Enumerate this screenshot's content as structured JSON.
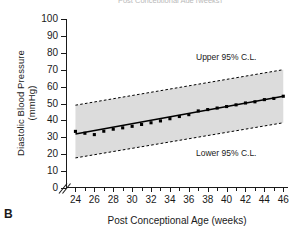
{
  "figure": {
    "panel_label": "B",
    "clipped_title_above": "Post Conceptional Age (weeks)"
  },
  "annotations": {
    "upper": "Upper 95% C.L.",
    "lower": "Lower 95% C.L."
  },
  "chart_data": {
    "type": "scatter",
    "title": "",
    "xlabel": "Post Conceptional Age (weeks)",
    "ylabel_line1": "Diastolic Blood Pressure",
    "ylabel_line2": "(mmHg)",
    "xlim": [
      23,
      46.5
    ],
    "ylim": [
      0,
      100
    ],
    "xticks": [
      24,
      25,
      26,
      27,
      28,
      29,
      30,
      31,
      32,
      33,
      34,
      35,
      36,
      37,
      38,
      39,
      40,
      41,
      42,
      43,
      44,
      45,
      46
    ],
    "xticklabels": [
      "24",
      "",
      "26",
      "",
      "28",
      "",
      "30",
      "",
      "32",
      "",
      "34",
      "",
      "36",
      "",
      "38",
      "",
      "40",
      "",
      "42",
      "",
      "44",
      "",
      "46"
    ],
    "yticks": [
      0,
      10,
      20,
      30,
      40,
      50,
      60,
      70,
      80,
      90,
      100
    ],
    "yticklabels": [
      "0",
      "10",
      "20",
      "30",
      "40",
      "50",
      "60",
      "70",
      "80",
      "90",
      "100"
    ],
    "grid": false,
    "axis_break_y": true,
    "legend_position": "none",
    "series": [
      {
        "name": "Mean diastolic blood pressure",
        "type": "scatter",
        "marker": "filled-square",
        "color": "#000000",
        "x": [
          24,
          25,
          26,
          27,
          28,
          29,
          30,
          31,
          32,
          33,
          34,
          35,
          36,
          37,
          38,
          39,
          40,
          41,
          42,
          43,
          44,
          45,
          46
        ],
        "values": [
          33.5,
          32.4,
          31.6,
          33.6,
          34.8,
          35.6,
          36.5,
          37.6,
          38.6,
          39.7,
          41.0,
          42.3,
          43.4,
          45.6,
          46.4,
          47.3,
          48.2,
          49.2,
          50.3,
          51.0,
          52.3,
          53.0,
          54.3
        ]
      },
      {
        "name": "Regression line",
        "type": "line",
        "style": "solid",
        "color": "#000000",
        "x": [
          24,
          46
        ],
        "values": [
          32.0,
          54.3
        ]
      },
      {
        "name": "Upper 95% C.L.",
        "type": "line",
        "style": "dotted",
        "color": "#000000",
        "x": [
          24,
          46
        ],
        "values": [
          49.0,
          70.0
        ]
      },
      {
        "name": "Lower 95% C.L.",
        "type": "line",
        "style": "dotted",
        "color": "#000000",
        "x": [
          24,
          46
        ],
        "values": [
          17.8,
          38.6
        ]
      }
    ],
    "band": {
      "name": "95% confidence band",
      "fill": "#dcdcdc",
      "between": [
        "Lower 95% C.L.",
        "Upper 95% C.L."
      ]
    }
  }
}
